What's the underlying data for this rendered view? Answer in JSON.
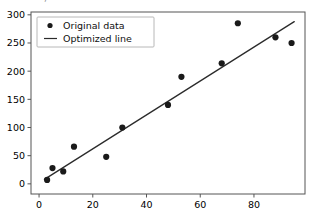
{
  "window": {
    "clipped_top_text": "─ ─ ── ─, ─ ──"
  },
  "chart_data": {
    "type": "scatter",
    "title": "",
    "xlabel": "",
    "ylabel": "",
    "xlim": [
      -3,
      99
    ],
    "ylim": [
      -18,
      305
    ],
    "xticks": [
      0,
      20,
      40,
      60,
      80
    ],
    "yticks": [
      0,
      50,
      100,
      150,
      200,
      250,
      300
    ],
    "grid": false,
    "legend_position": "upper left",
    "series": [
      {
        "name": "Original data",
        "type": "scatter",
        "marker": "circle",
        "color": "#1a1a1a",
        "x": [
          3,
          5,
          9,
          13,
          25,
          31,
          48,
          53,
          68,
          74,
          88,
          94
        ],
        "y": [
          7,
          28,
          22,
          66,
          48,
          100,
          140,
          190,
          214,
          285,
          260,
          250
        ]
      },
      {
        "name": "Optimized line",
        "type": "line",
        "color": "#2b2b2b",
        "x": [
          2,
          95
        ],
        "y": [
          8,
          288
        ]
      }
    ]
  },
  "legend": {
    "entries": [
      {
        "label": "Original data",
        "glyph": "marker-dot"
      },
      {
        "label": "Optimized line",
        "glyph": "line-segment"
      }
    ]
  },
  "axes": {
    "x_tick_labels": [
      "0",
      "20",
      "40",
      "60",
      "80"
    ],
    "y_tick_labels": [
      "0",
      "50",
      "100",
      "150",
      "200",
      "250",
      "300"
    ]
  }
}
